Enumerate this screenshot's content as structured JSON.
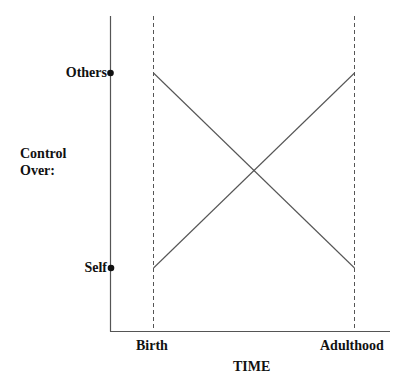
{
  "diagram": {
    "y_axis": {
      "title_line1": "Control",
      "title_line2": "Over:",
      "ticks": [
        {
          "label": "Others",
          "position": "high"
        },
        {
          "label": "Self",
          "position": "low"
        }
      ]
    },
    "x_axis": {
      "title": "TIME",
      "ticks": [
        {
          "label": "Birth"
        },
        {
          "label": "Adulthood"
        }
      ]
    },
    "lines": [
      {
        "name": "control-over-others",
        "from": "Others at Birth",
        "to": "Self at Adulthood",
        "style": "solid"
      },
      {
        "name": "control-over-self",
        "from": "Self at Birth",
        "to": "Others at Adulthood",
        "style": "solid"
      }
    ],
    "reference_lines": [
      {
        "at": "Birth",
        "style": "dashed"
      },
      {
        "at": "Adulthood",
        "style": "dashed"
      }
    ],
    "colors": {
      "axis": "#555555",
      "line": "#555555",
      "text": "#111111",
      "background": "#ffffff"
    }
  }
}
